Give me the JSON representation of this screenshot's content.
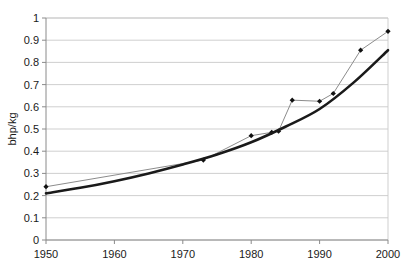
{
  "chart_data": {
    "type": "line",
    "title": "",
    "xlabel": "",
    "ylabel": "bhp/kg",
    "xlim": [
      1950,
      2000
    ],
    "ylim": [
      0,
      1
    ],
    "xticks": [
      1950,
      1960,
      1970,
      1980,
      1990,
      2000
    ],
    "yticks": [
      "0",
      "0.1",
      "0.2",
      "0.3",
      "0.4",
      "0.5",
      "0.6",
      "0.7",
      "0.8",
      "0.9",
      "1"
    ],
    "grid": "horizontal",
    "legend": "none",
    "series": [
      {
        "name": "measured",
        "style": "thin-line-with-markers",
        "marker": "filled-diamond",
        "color": "#8c8c8c",
        "marker_color": "#111111",
        "x": [
          1950,
          1973,
          1980,
          1983,
          1984,
          1986,
          1990,
          1992,
          1996,
          2000
        ],
        "values": [
          0.24,
          0.36,
          0.47,
          0.485,
          0.49,
          0.63,
          0.625,
          0.66,
          0.855,
          0.94
        ]
      },
      {
        "name": "trend",
        "style": "thick-smooth-line",
        "marker": "none",
        "color": "#1a1a1a",
        "x": [
          1950,
          1955,
          1960,
          1965,
          1970,
          1975,
          1980,
          1985,
          1990,
          1995,
          2000
        ],
        "values": [
          0.21,
          0.235,
          0.265,
          0.3,
          0.34,
          0.385,
          0.44,
          0.51,
          0.59,
          0.71,
          0.855
        ]
      }
    ]
  },
  "axis": {
    "y_title": "bhp/kg",
    "y_tick_labels": [
      "1",
      "0.9",
      "0.8",
      "0.7",
      "0.6",
      "0.5",
      "0.4",
      "0.3",
      "0.2",
      "0.1",
      "0"
    ],
    "x_tick_labels": [
      "1950",
      "1960",
      "1970",
      "1980",
      "1990",
      "2000"
    ]
  },
  "colors": {
    "grid": "#c9c9c9",
    "axis": "#8a8a8a",
    "trend_line": "#1a1a1a",
    "data_line": "#9a9a9a",
    "marker": "#111111",
    "background": "#ffffff"
  }
}
